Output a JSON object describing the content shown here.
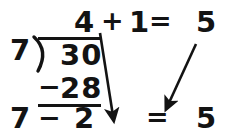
{
  "figure": {
    "background_color": "#ffffff",
    "ink_color": "#131313"
  },
  "division": {
    "divisor": "7",
    "dividend": "30",
    "quotient": "4",
    "subtract_sign": "−",
    "subtrahend": "28",
    "remainder": "2"
  },
  "top_equation": {
    "left_operand": "4",
    "operator": "+",
    "right_operand": "1",
    "equals": "=",
    "result": "5"
  },
  "bottom_equation": {
    "left_operand": "7",
    "operator": "−",
    "right_operand": "2",
    "equals": "=",
    "result": "5"
  },
  "arrows": [
    {
      "name": "quotient-to-remainder-arrow",
      "from": "quotient 4",
      "to": "bottom remainder area",
      "x1": 100,
      "y1": 33,
      "x2": 114,
      "y2": 117
    },
    {
      "name": "bottom-result-to-divisor-arrow",
      "from": "top result 5",
      "to": "bottom equals area",
      "x1": 196,
      "y1": 44,
      "x2": 168,
      "y2": 106
    }
  ]
}
